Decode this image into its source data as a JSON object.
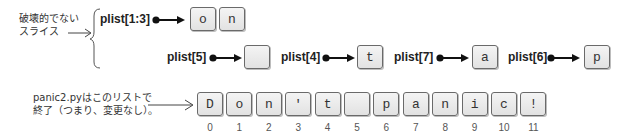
{
  "annotations": {
    "nondestructive_slice": [
      "破壊的でない",
      "スライス"
    ],
    "final_list_note": [
      "panic2.pyはこのリストで",
      "終了（つまり、変更なし）。"
    ]
  },
  "slices": [
    {
      "label": "plist[1:3]",
      "values": [
        "o",
        "n"
      ]
    },
    {
      "label": "plist[5]",
      "values": [
        " "
      ]
    },
    {
      "label": "plist[4]",
      "values": [
        "t"
      ]
    },
    {
      "label": "plist[7]",
      "values": [
        "a"
      ]
    },
    {
      "label": "plist[6]",
      "values": [
        "p"
      ]
    }
  ],
  "list": {
    "values": [
      "D",
      "o",
      "n",
      "'",
      "t",
      " ",
      "p",
      "a",
      "n",
      "i",
      "c",
      "!"
    ],
    "indices": [
      "0",
      "1",
      "2",
      "3",
      "4",
      "5",
      "6",
      "7",
      "8",
      "9",
      "10",
      "11"
    ]
  }
}
